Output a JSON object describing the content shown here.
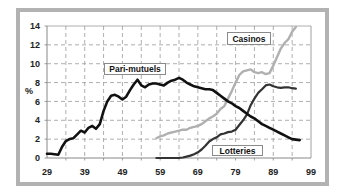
{
  "chart_data": {
    "type": "line",
    "title": "",
    "xlabel": "",
    "ylabel": "%",
    "xlim": [
      29,
      99
    ],
    "ylim": [
      0,
      14
    ],
    "xticks": [
      29,
      39,
      49,
      59,
      69,
      79,
      89,
      99
    ],
    "yticks": [
      0,
      2,
      4,
      6,
      8,
      10,
      12,
      14
    ],
    "grid": true,
    "grid_x_step": 5,
    "legend": "inline text boxes",
    "series": [
      {
        "name": "Pari-mutuels",
        "color": "#111111",
        "width": 2.6,
        "x": [
          29,
          30,
          31,
          32,
          33,
          34,
          35,
          36,
          37,
          38,
          39,
          40,
          41,
          42,
          43,
          44,
          45,
          46,
          47,
          48,
          49,
          50,
          51,
          52,
          53,
          54,
          55,
          56,
          57,
          58,
          59,
          60,
          61,
          62,
          63,
          64,
          65,
          66,
          67,
          68,
          69,
          70,
          71,
          72,
          73,
          74,
          75,
          76,
          77,
          78,
          79,
          80,
          81,
          82,
          83,
          84,
          85,
          86,
          87,
          88,
          89,
          90,
          91,
          92,
          93,
          94,
          95,
          96
        ],
        "values": [
          0.45,
          0.45,
          0.4,
          0.35,
          1.2,
          1.8,
          2.0,
          2.1,
          2.5,
          2.9,
          2.7,
          3.2,
          3.4,
          3.1,
          3.6,
          5.0,
          6.0,
          6.6,
          6.7,
          6.5,
          6.2,
          6.5,
          7.2,
          7.8,
          8.3,
          7.7,
          7.5,
          7.8,
          7.9,
          7.9,
          7.8,
          7.7,
          8.0,
          8.2,
          8.3,
          8.5,
          8.3,
          8.0,
          7.8,
          7.6,
          7.5,
          7.4,
          7.3,
          7.3,
          7.2,
          6.9,
          6.6,
          6.3,
          6.0,
          5.8,
          5.5,
          5.3,
          5.0,
          4.7,
          4.4,
          4.2,
          3.9,
          3.6,
          3.4,
          3.2,
          3.0,
          2.8,
          2.6,
          2.4,
          2.2,
          2.0,
          1.95,
          1.9
        ]
      },
      {
        "name": "Casinos",
        "color": "#b0b0b0",
        "width": 2.4,
        "x": [
          58,
          59,
          60,
          61,
          62,
          63,
          64,
          65,
          66,
          67,
          68,
          69,
          70,
          71,
          72,
          73,
          74,
          75,
          76,
          77,
          78,
          79,
          80,
          81,
          82,
          83,
          84,
          85,
          86,
          87,
          88,
          89,
          90,
          91,
          92,
          93,
          94,
          95
        ],
        "values": [
          2.1,
          2.3,
          2.4,
          2.6,
          2.7,
          2.8,
          2.9,
          3.0,
          3.0,
          3.2,
          3.3,
          3.4,
          3.6,
          3.9,
          4.2,
          4.4,
          4.7,
          5.2,
          5.5,
          6.3,
          7.1,
          8.0,
          8.8,
          9.2,
          9.3,
          9.4,
          9.1,
          9.0,
          9.1,
          8.9,
          9.0,
          9.8,
          10.7,
          11.6,
          12.2,
          12.6,
          13.4,
          13.9
        ]
      },
      {
        "name": "Lotteries",
        "color": "#333333",
        "width": 2.2,
        "x": [
          58,
          59,
          60,
          61,
          62,
          63,
          64,
          65,
          66,
          67,
          68,
          69,
          70,
          71,
          72,
          73,
          74,
          75,
          76,
          77,
          78,
          79,
          80,
          81,
          82,
          83,
          84,
          85,
          86,
          87,
          88,
          89,
          90,
          91,
          92,
          93,
          94,
          95
        ],
        "values": [
          0,
          0,
          0,
          0,
          0,
          0,
          0.02,
          0.05,
          0.15,
          0.25,
          0.4,
          0.6,
          0.9,
          1.3,
          1.75,
          2.0,
          2.2,
          2.5,
          2.6,
          2.75,
          2.8,
          3.0,
          3.5,
          4.0,
          4.6,
          5.6,
          6.3,
          6.9,
          7.3,
          7.7,
          7.8,
          7.6,
          7.5,
          7.45,
          7.5,
          7.5,
          7.4,
          7.35
        ]
      }
    ]
  },
  "colors": {
    "frame_border": "#b2b2b2",
    "grid": "#9a9a9a",
    "axis": "#888888"
  }
}
